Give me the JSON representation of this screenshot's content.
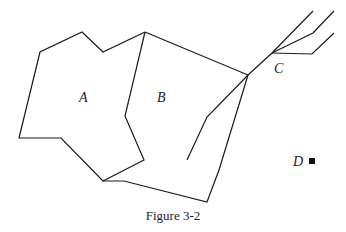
{
  "figure": {
    "caption": "Figure 3-2",
    "stroke_color": "#1a1a1a",
    "labels": {
      "a": "A",
      "b": "B",
      "c": "C",
      "d": "D"
    },
    "regions": [
      {
        "name": "region-a",
        "label": "A"
      },
      {
        "name": "region-b",
        "label": "B"
      }
    ],
    "point_d": {
      "label": "D",
      "marker": "filled-square"
    }
  }
}
